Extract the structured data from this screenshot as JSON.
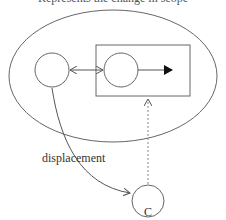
{
  "caption": "Represents the change in scope",
  "labels": {
    "displacement": "displacement",
    "node_c": "C"
  },
  "colors": {
    "stroke": "#555555",
    "text": "#333333",
    "background": "#ffffff"
  }
}
